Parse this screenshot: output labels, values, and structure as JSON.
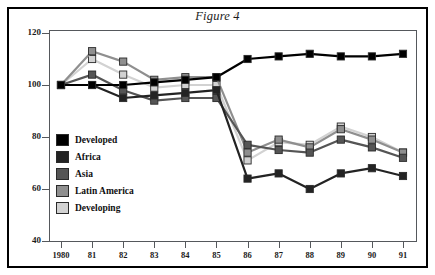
{
  "figure": {
    "label": "Figure 4",
    "title": "Terms of trade",
    "subtitle": " – Index 1980 = 100"
  },
  "legend": {
    "items": [
      {
        "label": "Developed",
        "color": "#000000"
      },
      {
        "label": "Africa",
        "color": "#232323"
      },
      {
        "label": "Asia",
        "color": "#555555"
      },
      {
        "label": "Latin America",
        "color": "#8f8f8f"
      },
      {
        "label": "Developing",
        "color": "#d2d2d2"
      }
    ]
  },
  "chart_data": {
    "type": "line",
    "title": "Terms of trade – Index 1980 = 100",
    "xlabel": "",
    "ylabel": "",
    "grid": false,
    "legend_position": "inside-left",
    "x": [
      1980,
      1981,
      1982,
      1983,
      1984,
      1985,
      1986,
      1987,
      1988,
      1989,
      1990,
      1991
    ],
    "categories": [
      "1980",
      "81",
      "82",
      "83",
      "84",
      "85",
      "86",
      "87",
      "88",
      "89",
      "90",
      "91"
    ],
    "xlim": [
      1980,
      1991
    ],
    "ylim": [
      40,
      120
    ],
    "yticks": [
      40,
      60,
      80,
      100,
      120
    ],
    "series": [
      {
        "name": "Developed",
        "color": "#000000",
        "values": [
          100,
          100,
          100,
          101,
          102,
          103,
          110,
          111,
          112,
          111,
          111,
          112
        ]
      },
      {
        "name": "Africa",
        "color": "#232323",
        "values": [
          100,
          100,
          95,
          96,
          97,
          98,
          64,
          66,
          60,
          66,
          68,
          65
        ]
      },
      {
        "name": "Asia",
        "color": "#555555",
        "values": [
          100,
          104,
          98,
          94,
          95,
          95,
          77,
          75,
          74,
          79,
          76,
          72
        ]
      },
      {
        "name": "Latin America",
        "color": "#8f8f8f",
        "values": [
          100,
          113,
          109,
          102,
          103,
          103,
          74,
          79,
          76,
          83,
          79,
          74
        ]
      },
      {
        "name": "Developing",
        "color": "#d2d2d2",
        "values": [
          100,
          110,
          104,
          99,
          100,
          100,
          71,
          78,
          77,
          84,
          80,
          74
        ]
      }
    ]
  }
}
